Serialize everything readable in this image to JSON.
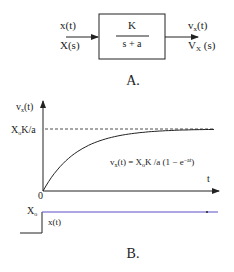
{
  "diagram_a": {
    "input_time": "x(t)",
    "input_laplace": "X(s)",
    "transfer_numerator": "K",
    "transfer_denominator": "s + a",
    "output_time_main": "v",
    "output_time_sub": "x",
    "output_time_rest": "(t)",
    "output_laplace_main": "V",
    "output_laplace_sub": "X",
    "output_laplace_rest": " (s)",
    "caption": "A."
  },
  "diagram_b": {
    "y_axis_label_main": "v",
    "y_axis_label_sub": "x",
    "y_axis_label_rest": "(t)",
    "asymptote_label_main": "X",
    "asymptote_label_sub": "o",
    "asymptote_label_rest": "K/a",
    "equation_part1": "v",
    "equation_sub1": "x",
    "equation_part2": "(t) = X",
    "equation_sub2": "o",
    "equation_part3": "K /a (1 − e",
    "equation_sup": "−at",
    "equation_part4": ")",
    "x_axis_label": "t",
    "origin_label": "0",
    "step_level_main": "X",
    "step_level_sub": "o",
    "step_label": "x(t)",
    "caption": "B.",
    "step_line_color": "#5a50c8"
  }
}
